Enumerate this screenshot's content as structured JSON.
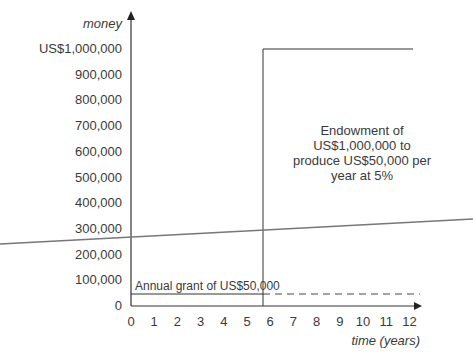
{
  "chart_data": {
    "type": "line",
    "title": "",
    "xlabel": "time (years)",
    "ylabel": "money",
    "x_ticks": [
      "0",
      "1",
      "2",
      "3",
      "4",
      "5",
      "6",
      "7",
      "8",
      "9",
      "10",
      "11",
      "12"
    ],
    "y_ticks": [
      "0",
      "100,000",
      "200,000",
      "300,000",
      "400,000",
      "500,000",
      "600,000",
      "700,000",
      "800,000",
      "900,000",
      "US$1,000,000"
    ],
    "xlim": [
      0,
      12
    ],
    "ylim": [
      0,
      1000000
    ],
    "series": [
      {
        "name": "Annual grant",
        "style": "solid then dashed",
        "x": [
          0,
          5.6,
          12
        ],
        "y": [
          50000,
          50000,
          50000
        ]
      },
      {
        "name": "Endowment",
        "style": "step",
        "x": [
          5.6,
          5.6,
          12
        ],
        "y": [
          0,
          1000000,
          1000000
        ]
      }
    ],
    "annotations": [
      {
        "text": "Annual grant of US$50,000"
      },
      {
        "text": "Endowment of US$1,000,000 to produce US$50,000 per year at 5%"
      }
    ],
    "grid": false,
    "legend": "none"
  },
  "labels": {
    "ylabel": "money",
    "xlabel": "time (years)",
    "grant_note": "Annual grant of US$50,000",
    "endow_note_1": "Endowment of",
    "endow_note_2": "US$1,000,000 to",
    "endow_note_3": "produce US$50,000 per",
    "endow_note_4": "year at 5%"
  },
  "y_ticks": [
    "0",
    "100,000",
    "200,000",
    "300,000",
    "400,000",
    "500,000",
    "600,000",
    "700,000",
    "800,000",
    "900,000",
    "US$1,000,000"
  ],
  "x_ticks": [
    "0",
    "1",
    "2",
    "3",
    "4",
    "5",
    "6",
    "7",
    "8",
    "9",
    "10",
    "11",
    "12"
  ]
}
